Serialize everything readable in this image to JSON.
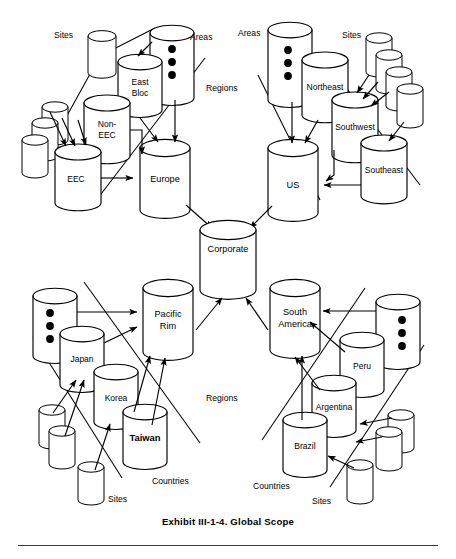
{
  "figure": {
    "caption": "Exhibit III-1-4. Global Scope",
    "type": "hierarchy-diagram",
    "background": "#ffffff",
    "ink": "#000000"
  },
  "category_labels": {
    "tl_sites": "Sites",
    "tl_areas": "Areas",
    "tl_regions": "Regions",
    "tr_areas": "Areas",
    "tr_sites": "Sites",
    "bl_countries": "Countries",
    "bl_sites": "Sites",
    "br_regions": "Regions",
    "br_countries": "Countries",
    "br_sites": "Sites"
  },
  "nodes": {
    "corporate": "Corporate",
    "europe": "Europe",
    "us": "US",
    "pacific_rim_line1": "Pacific",
    "pacific_rim_line2": "Rim",
    "south_america_line1": "South",
    "south_america_line2": "America",
    "east_bloc_line1": "East",
    "east_bloc_line2": "Bloc",
    "non_eec_line1": "Non-",
    "non_eec_line2": "EEC",
    "eec": "EEC",
    "northeast": "Northeast",
    "southwest": "Southwest",
    "southeast": "Southeast",
    "japan": "Japan",
    "korea": "Korea",
    "taiwan": "Taiwan",
    "peru": "Peru",
    "argentina": "Argentina",
    "brazil": "Brazil"
  },
  "hierarchy": {
    "root": "Corporate",
    "regions": [
      "Europe",
      "US",
      "Pacific Rim",
      "South America"
    ],
    "areas_or_countries": {
      "Europe": [
        "East Bloc",
        "Non-EEC",
        "EEC"
      ],
      "US": [
        "Northeast",
        "Southwest",
        "Southeast"
      ],
      "Pacific Rim": [
        "Japan",
        "Korea",
        "Taiwan"
      ],
      "South America": [
        "Peru",
        "Argentina",
        "Brazil"
      ]
    }
  },
  "ellipsis_dot_count": 3
}
